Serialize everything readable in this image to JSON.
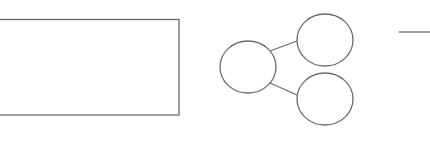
{
  "diagram": {
    "nodes": [
      {
        "id": "box",
        "shape": "rectangle",
        "label": ""
      },
      {
        "id": "left-circle",
        "shape": "circle",
        "label": ""
      },
      {
        "id": "top-right-circle",
        "shape": "circle",
        "label": ""
      },
      {
        "id": "bottom-right-circle",
        "shape": "circle",
        "label": ""
      }
    ],
    "edges": [
      {
        "from": "left-circle",
        "to": "top-right-circle"
      },
      {
        "from": "left-circle",
        "to": "bottom-right-circle"
      }
    ],
    "stroke_color": "#6a6a6a",
    "background_color": "#ffffff"
  }
}
